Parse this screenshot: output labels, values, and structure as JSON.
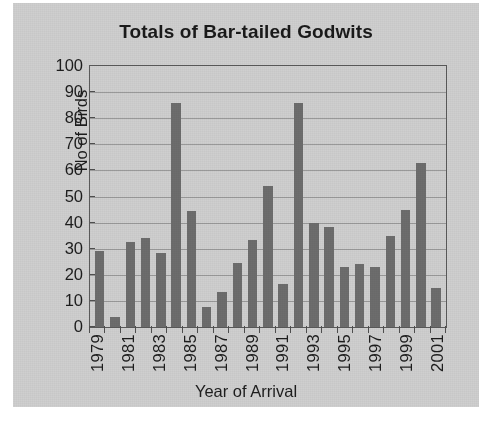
{
  "chart_data": {
    "type": "bar",
    "title": "Totals of Bar-tailed Godwits",
    "xlabel": "Year of Arrival",
    "ylabel": "No of Birds",
    "ylim": [
      0,
      100
    ],
    "ytick_step": 10,
    "yticks": [
      0,
      10,
      20,
      30,
      40,
      50,
      60,
      70,
      80,
      90,
      100
    ],
    "grid": true,
    "legend": null,
    "legend_position": "none",
    "bar_color": "#6d6d6d",
    "plot_background": "#cfcfcf",
    "axis_color": "#5a5a5a",
    "gridline_color": "#9a9a9a",
    "text_color": "#1d1d1d",
    "categories": [
      "1979",
      "1980",
      "1981",
      "1982",
      "1983",
      "1984",
      "1985",
      "1986",
      "1987",
      "1988",
      "1989",
      "1990",
      "1991",
      "1992",
      "1993",
      "1994",
      "1995",
      "1996",
      "1997",
      "1998",
      "1999",
      "2000",
      "2001"
    ],
    "values": [
      29,
      4,
      32.5,
      34,
      28.5,
      86,
      44.5,
      7.5,
      13.5,
      24.5,
      33.5,
      54,
      16.5,
      86,
      40,
      38.5,
      23,
      24,
      23,
      35,
      45,
      63,
      15
    ],
    "visible_xtick_labels": [
      "1979",
      "1981",
      "1983",
      "1985",
      "1987",
      "1989",
      "1991",
      "1993",
      "1995",
      "1997",
      "1999",
      "2001"
    ],
    "visible_xtick_indices": [
      0,
      2,
      4,
      6,
      8,
      10,
      12,
      14,
      16,
      18,
      20,
      22
    ]
  }
}
